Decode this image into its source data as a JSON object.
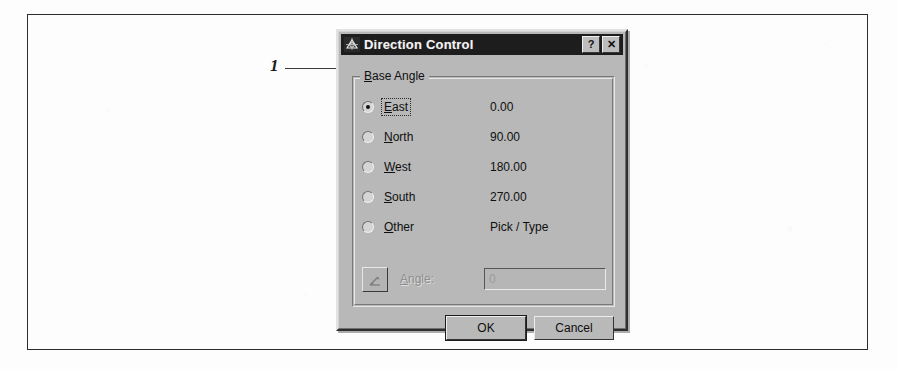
{
  "callout": {
    "number": "1"
  },
  "dialog": {
    "title": "Direction Control",
    "title_icon": "compass-icon",
    "titlebar_buttons": [
      {
        "name": "help-button",
        "label": "?"
      },
      {
        "name": "close-button",
        "label": "✕"
      }
    ],
    "group": {
      "label": "Base Angle",
      "label_accel": "B",
      "options": [
        {
          "label": "East",
          "accel": "E",
          "value": "0.00",
          "selected": true,
          "focused": true
        },
        {
          "label": "North",
          "accel": "N",
          "value": "90.00",
          "selected": false,
          "focused": false
        },
        {
          "label": "West",
          "accel": "W",
          "value": "180.00",
          "selected": false,
          "focused": false
        },
        {
          "label": "South",
          "accel": "S",
          "value": "270.00",
          "selected": false,
          "focused": false
        },
        {
          "label": "Other",
          "accel": "O",
          "value": "Pick / Type",
          "selected": false,
          "focused": false
        }
      ],
      "angle_row": {
        "pick_button_icon": "pick-angle-icon",
        "label": "Angle:",
        "label_accel": "A",
        "field_value": "0",
        "enabled": false
      }
    },
    "buttons": {
      "ok": "OK",
      "cancel": "Cancel"
    }
  },
  "colors": {
    "dialog_face": "#b8b8b8",
    "titlebar": "#1d1d1d",
    "titlebar_text": "#f2f2f2",
    "text": "#0f0f0f",
    "disabled_text": "#8e8e8e",
    "frame_border": "#2c2c2c",
    "page_background": "#fdfdfd"
  }
}
